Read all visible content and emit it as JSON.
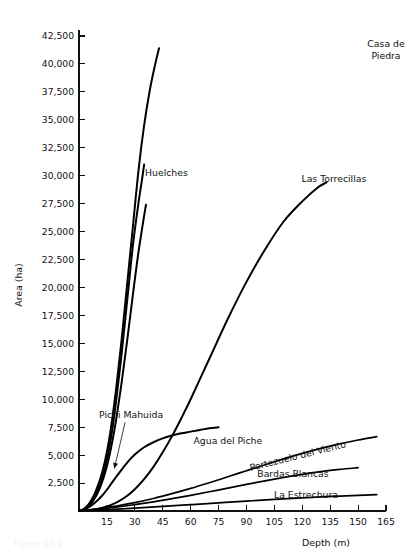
{
  "figure": {
    "background_color": "#ffffff",
    "line_color": "#000000",
    "text_color": "#111111",
    "caption_partial": "Figure 10.2"
  },
  "chart_data": {
    "type": "line",
    "title": "",
    "subtitle": "",
    "xlabel": "Depth (m)",
    "ylabel": "Area (ha)",
    "xlim": [
      0,
      165
    ],
    "ylim": [
      0,
      43750
    ],
    "grid": false,
    "legend_position": "inline-labels",
    "x_ticks": [
      15,
      30,
      45,
      60,
      75,
      90,
      105,
      120,
      135,
      150,
      165
    ],
    "x_tick_labels": [
      "15",
      "30",
      "45",
      "60",
      "75",
      "90",
      "105",
      "120",
      "135",
      "150",
      "165"
    ],
    "y_ticks": [
      2500,
      5000,
      7500,
      10000,
      12500,
      15000,
      17500,
      20000,
      22500,
      25000,
      27500,
      30000,
      32500,
      35000,
      37500,
      40000,
      42500
    ],
    "y_tick_labels": [
      "2,500",
      "5,000",
      "7,500",
      "10,000",
      "12,500",
      "15,000",
      "17,500",
      "20,000",
      "22,500",
      "25,000",
      "27,500",
      "30,000",
      "32,500",
      "35,000",
      "37,500",
      "40,000",
      "42,500"
    ],
    "series": [
      {
        "name": "Casa de Piedra",
        "label": "Casa de Piedra",
        "label_lines": [
          "Casa de",
          "Piedra"
        ],
        "label_x": 165,
        "label_y": 41500,
        "points": [
          [
            0,
            0
          ],
          [
            2,
            120
          ],
          [
            4,
            380
          ],
          [
            6,
            800
          ],
          [
            8,
            1400
          ],
          [
            10,
            2200
          ],
          [
            12,
            3200
          ],
          [
            14,
            4500
          ],
          [
            16,
            6200
          ],
          [
            18,
            8400
          ],
          [
            20,
            11000
          ],
          [
            23,
            15500
          ],
          [
            26,
            20500
          ],
          [
            29,
            25500
          ],
          [
            32,
            30500
          ],
          [
            35,
            34500
          ],
          [
            38,
            37600
          ],
          [
            41,
            40000
          ],
          [
            43,
            41400
          ]
        ]
      },
      {
        "name": "Huelches",
        "label": "Huelches",
        "label_x": 47,
        "label_y": 30000,
        "points": [
          [
            0,
            0
          ],
          [
            2,
            90
          ],
          [
            4,
            300
          ],
          [
            6,
            650
          ],
          [
            8,
            1150
          ],
          [
            10,
            1800
          ],
          [
            12,
            2700
          ],
          [
            14,
            3850
          ],
          [
            16,
            5400
          ],
          [
            18,
            7400
          ],
          [
            20,
            9900
          ],
          [
            23,
            14200
          ],
          [
            26,
            19000
          ],
          [
            29,
            23800
          ],
          [
            32,
            27600
          ],
          [
            34,
            29800
          ],
          [
            35,
            31000
          ]
        ]
      },
      {
        "name": "Las Torrecillas",
        "label": "Las Torrecillas",
        "label_x": 137,
        "label_y": 29400,
        "points": [
          [
            0,
            0
          ],
          [
            5,
            60
          ],
          [
            10,
            180
          ],
          [
            15,
            400
          ],
          [
            20,
            750
          ],
          [
            25,
            1250
          ],
          [
            30,
            1950
          ],
          [
            35,
            2850
          ],
          [
            40,
            3950
          ],
          [
            45,
            5250
          ],
          [
            50,
            6700
          ],
          [
            55,
            8300
          ],
          [
            60,
            10000
          ],
          [
            70,
            13600
          ],
          [
            80,
            17200
          ],
          [
            90,
            20500
          ],
          [
            100,
            23400
          ],
          [
            110,
            25900
          ],
          [
            120,
            27700
          ],
          [
            128,
            28900
          ],
          [
            133,
            29400
          ]
        ]
      },
      {
        "name": "Pichi Mahuida",
        "label": "Pichi Mahuida",
        "label_x": 28,
        "label_y": 8300,
        "annotation": "arrow-leader",
        "arrow_tip_x": 19,
        "arrow_tip_y": 3800,
        "points": [
          [
            0,
            0
          ],
          [
            2,
            80
          ],
          [
            4,
            260
          ],
          [
            6,
            560
          ],
          [
            8,
            1000
          ],
          [
            10,
            1600
          ],
          [
            12,
            2400
          ],
          [
            14,
            3400
          ],
          [
            16,
            4700
          ],
          [
            18,
            6300
          ],
          [
            20,
            8200
          ],
          [
            23,
            11600
          ],
          [
            26,
            15400
          ],
          [
            29,
            19400
          ],
          [
            32,
            23200
          ],
          [
            35,
            26400
          ],
          [
            36,
            27400
          ]
        ]
      },
      {
        "name": "Agua del Piche",
        "label": "Agua del Piche",
        "label_x": 80,
        "label_y": 6000,
        "points": [
          [
            0,
            0
          ],
          [
            3,
            150
          ],
          [
            6,
            420
          ],
          [
            9,
            800
          ],
          [
            12,
            1300
          ],
          [
            15,
            1900
          ],
          [
            18,
            2600
          ],
          [
            22,
            3500
          ],
          [
            26,
            4350
          ],
          [
            30,
            5050
          ],
          [
            35,
            5700
          ],
          [
            40,
            6150
          ],
          [
            45,
            6500
          ],
          [
            50,
            6750
          ],
          [
            55,
            6950
          ],
          [
            60,
            7100
          ],
          [
            65,
            7250
          ],
          [
            70,
            7400
          ],
          [
            75,
            7500
          ]
        ]
      },
      {
        "name": "Portezuelo del Viento",
        "label": "Portezuelo del Viento",
        "label_x": 118,
        "label_y": 4650,
        "points": [
          [
            0,
            0
          ],
          [
            10,
            200
          ],
          [
            20,
            450
          ],
          [
            30,
            750
          ],
          [
            40,
            1120
          ],
          [
            50,
            1550
          ],
          [
            60,
            2020
          ],
          [
            70,
            2530
          ],
          [
            80,
            3060
          ],
          [
            90,
            3600
          ],
          [
            100,
            4140
          ],
          [
            110,
            4660
          ],
          [
            120,
            5150
          ],
          [
            130,
            5600
          ],
          [
            140,
            6000
          ],
          [
            150,
            6350
          ],
          [
            160,
            6650
          ]
        ]
      },
      {
        "name": "Bardas Blancas",
        "label": "Bardas Blancas",
        "label_x": 115,
        "label_y": 3050,
        "points": [
          [
            0,
            0
          ],
          [
            10,
            160
          ],
          [
            20,
            350
          ],
          [
            30,
            570
          ],
          [
            40,
            820
          ],
          [
            50,
            1100
          ],
          [
            60,
            1400
          ],
          [
            70,
            1720
          ],
          [
            80,
            2050
          ],
          [
            90,
            2380
          ],
          [
            100,
            2700
          ],
          [
            110,
            3000
          ],
          [
            120,
            3280
          ],
          [
            130,
            3520
          ],
          [
            140,
            3720
          ],
          [
            150,
            3880
          ]
        ]
      },
      {
        "name": "La Estrechura",
        "label": "La Estrechura",
        "label_x": 122,
        "label_y": 1150,
        "points": [
          [
            0,
            0
          ],
          [
            15,
            120
          ],
          [
            30,
            260
          ],
          [
            45,
            410
          ],
          [
            60,
            570
          ],
          [
            75,
            730
          ],
          [
            90,
            890
          ],
          [
            105,
            1040
          ],
          [
            120,
            1180
          ],
          [
            135,
            1300
          ],
          [
            150,
            1400
          ],
          [
            160,
            1460
          ]
        ]
      }
    ]
  }
}
